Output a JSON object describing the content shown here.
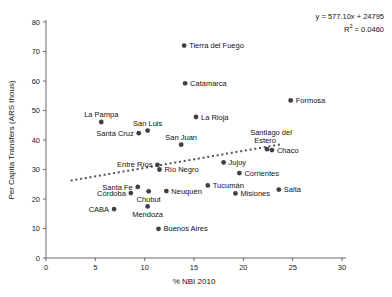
{
  "chart_data": {
    "type": "scatter",
    "title": "",
    "xlabel": "% NBI 2010",
    "ylabel": "Per Capita Transfers (ARS thous)",
    "xlim": [
      0,
      30
    ],
    "ylim": [
      0,
      80
    ],
    "xticks": [
      0,
      5,
      10,
      15,
      20,
      25,
      30
    ],
    "yticks": [
      0,
      10,
      20,
      30,
      40,
      50,
      60,
      70,
      80
    ],
    "grid": false,
    "legend": null,
    "annotations": {
      "equation": "y = 577.10x + 24795",
      "r_squared_prefix": "R",
      "r_squared_sup": "2",
      "r_squared_value": " = 0.0460"
    },
    "trendline": {
      "slope": 0.5771,
      "intercept": 24.795,
      "style": "dotted",
      "x_start": 2.6,
      "x_end": 23.6
    },
    "points": [
      {
        "label": "Tierra del Fuego",
        "x": 14.0,
        "y": 72.0,
        "label_pos": "right"
      },
      {
        "label": "Catamarca",
        "x": 14.1,
        "y": 59.2,
        "label_pos": "right"
      },
      {
        "label": "Formosa",
        "x": 24.8,
        "y": 53.4,
        "label_pos": "right"
      },
      {
        "label": "La Pampa",
        "x": 5.6,
        "y": 46.1,
        "label_pos": "above"
      },
      {
        "label": "La Rioja",
        "x": 15.2,
        "y": 47.8,
        "label_pos": "right"
      },
      {
        "label": "San Luis",
        "x": 10.3,
        "y": 43.2,
        "label_pos": "above"
      },
      {
        "label": "Santa Cruz",
        "x": 9.4,
        "y": 42.3,
        "label_pos": "left"
      },
      {
        "label": "San Juan",
        "x": 13.7,
        "y": 38.4,
        "label_pos": "above"
      },
      {
        "label": "Santiago del Estero",
        "x": 22.4,
        "y": 36.9,
        "label_pos": "above"
      },
      {
        "label": "Chaco",
        "x": 22.9,
        "y": 36.6,
        "label_pos": "right"
      },
      {
        "label": "Jujuy",
        "x": 18.0,
        "y": 32.4,
        "label_pos": "right"
      },
      {
        "label": "Entre Ríos",
        "x": 11.3,
        "y": 31.6,
        "label_pos": "left"
      },
      {
        "label": "Río Negro",
        "x": 11.5,
        "y": 30.0,
        "label_pos": "right"
      },
      {
        "label": "Corrientes",
        "x": 19.6,
        "y": 28.8,
        "label_pos": "right"
      },
      {
        "label": "Tucumán",
        "x": 16.4,
        "y": 24.6,
        "label_pos": "right"
      },
      {
        "label": "Santa Fe",
        "x": 9.3,
        "y": 24.1,
        "label_pos": "left"
      },
      {
        "label": "Salta",
        "x": 23.6,
        "y": 23.2,
        "label_pos": "right"
      },
      {
        "label": "Neuquén",
        "x": 12.2,
        "y": 22.7,
        "label_pos": "right"
      },
      {
        "label": "Chubut",
        "x": 10.4,
        "y": 22.6,
        "label_pos": "below"
      },
      {
        "label": "Córdoba",
        "x": 8.6,
        "y": 22.0,
        "label_pos": "left"
      },
      {
        "label": "Misiones",
        "x": 19.2,
        "y": 21.9,
        "label_pos": "right"
      },
      {
        "label": "Mendoza",
        "x": 10.3,
        "y": 17.5,
        "label_pos": "below"
      },
      {
        "label": "CABA",
        "x": 6.9,
        "y": 16.6,
        "label_pos": "left"
      },
      {
        "label": "Buenos Aires",
        "x": 11.4,
        "y": 9.9,
        "label_pos": "right"
      }
    ]
  }
}
